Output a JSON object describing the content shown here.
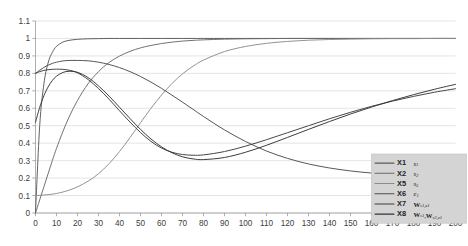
{
  "chart_data": {
    "type": "line",
    "title": "",
    "xlabel": "",
    "ylabel": "",
    "xlim": [
      0,
      200
    ],
    "ylim": [
      0,
      1.1
    ],
    "grid": true,
    "legend_position": "bottom-right",
    "xticks": [
      0,
      10,
      20,
      30,
      40,
      50,
      60,
      70,
      80,
      90,
      100,
      110,
      120,
      130,
      140,
      150,
      160,
      170,
      180,
      190,
      200
    ],
    "yticks": [
      "0",
      "0.1",
      "0.2",
      "0.3",
      "0.4",
      "0.5",
      "0.6",
      "0.7",
      "0.8",
      "0.9",
      "1",
      "1.1"
    ],
    "x": [
      0,
      2,
      4,
      6,
      8,
      10,
      13,
      16,
      20,
      25,
      30,
      35,
      40,
      45,
      50,
      55,
      60,
      65,
      70,
      75,
      80,
      90,
      100,
      110,
      120,
      130,
      140,
      150,
      160,
      170,
      180,
      190,
      200
    ],
    "series": [
      {
        "name": "X1",
        "math": "s1",
        "color": "#5a5a5a",
        "values": [
          0.0,
          0.5,
          0.74,
          0.86,
          0.92,
          0.955,
          0.979,
          0.989,
          0.995,
          0.998,
          0.999,
          1.0,
          1.0,
          1.0,
          1.0,
          1.0,
          1.0,
          1.0,
          1.0,
          1.0,
          1.0,
          1.0,
          1.0,
          1.0,
          1.0,
          1.0,
          1.0,
          1.0,
          1.0,
          1.0,
          1.0,
          1.0,
          1.0
        ]
      },
      {
        "name": "X2",
        "math": "s2",
        "color": "#6a6a6a",
        "values": [
          0.0,
          0.075,
          0.15,
          0.225,
          0.3,
          0.37,
          0.465,
          0.55,
          0.645,
          0.74,
          0.81,
          0.862,
          0.899,
          0.926,
          0.946,
          0.96,
          0.971,
          0.979,
          0.985,
          0.989,
          0.992,
          0.996,
          0.998,
          0.999,
          1.0,
          1.0,
          1.0,
          1.0,
          1.0,
          1.0,
          1.0,
          1.0,
          1.0
        ]
      },
      {
        "name": "X5",
        "math": "s5",
        "color": "#8c8c8c",
        "values": [
          0.1,
          0.101,
          0.103,
          0.105,
          0.108,
          0.112,
          0.12,
          0.131,
          0.15,
          0.182,
          0.225,
          0.282,
          0.352,
          0.432,
          0.517,
          0.6,
          0.676,
          0.742,
          0.797,
          0.841,
          0.876,
          0.925,
          0.954,
          0.972,
          0.983,
          0.99,
          0.994,
          0.996,
          0.998,
          0.999,
          0.999,
          1.0,
          1.0
        ]
      },
      {
        "name": "X6",
        "math": "e1",
        "color": "#4e4e4e",
        "values": [
          0.8,
          0.818,
          0.834,
          0.847,
          0.857,
          0.864,
          0.871,
          0.874,
          0.874,
          0.872,
          0.864,
          0.851,
          0.833,
          0.81,
          0.782,
          0.75,
          0.714,
          0.675,
          0.635,
          0.594,
          0.553,
          0.476,
          0.41,
          0.355,
          0.313,
          0.281,
          0.258,
          0.241,
          0.229,
          0.221,
          0.214,
          0.209,
          0.205
        ]
      },
      {
        "name": "X7",
        "math": "W_s1_e1",
        "color": "#3d3d3d",
        "values": [
          0.8,
          0.81,
          0.817,
          0.821,
          0.823,
          0.824,
          0.823,
          0.818,
          0.803,
          0.765,
          0.713,
          0.652,
          0.586,
          0.521,
          0.461,
          0.41,
          0.372,
          0.348,
          0.335,
          0.331,
          0.333,
          0.352,
          0.383,
          0.42,
          0.46,
          0.5,
          0.54,
          0.577,
          0.611,
          0.641,
          0.668,
          0.692,
          0.712
        ]
      },
      {
        "name": "X8",
        "math": "W_s1_W_s2_e1",
        "color": "#333333",
        "values": [
          0.52,
          0.605,
          0.672,
          0.722,
          0.759,
          0.784,
          0.805,
          0.812,
          0.806,
          0.776,
          0.728,
          0.67,
          0.606,
          0.541,
          0.479,
          0.424,
          0.379,
          0.345,
          0.322,
          0.31,
          0.306,
          0.318,
          0.348,
          0.388,
          0.433,
          0.479,
          0.524,
          0.567,
          0.607,
          0.644,
          0.678,
          0.709,
          0.737
        ]
      }
    ],
    "legend_entries": [
      {
        "name": "X1",
        "math_main": "s",
        "math_sub": "1",
        "math_bold": false,
        "math_second": "",
        "math_second_sub": ""
      },
      {
        "name": "X2",
        "math_main": "s",
        "math_sub": "2",
        "math_bold": false,
        "math_second": "",
        "math_second_sub": ""
      },
      {
        "name": "X5",
        "math_main": "s",
        "math_sub": "5",
        "math_bold": false,
        "math_second": "",
        "math_second_sub": ""
      },
      {
        "name": "X6",
        "math_main": "e",
        "math_sub": "1",
        "math_bold": false,
        "math_second": "",
        "math_second_sub": ""
      },
      {
        "name": "X7",
        "math_main": "W",
        "math_sub": "s1,e1",
        "math_bold": true,
        "math_second": "",
        "math_second_sub": ""
      },
      {
        "name": "X8",
        "math_main": "W",
        "math_sub": "s1",
        "math_bold": true,
        "math_second": "W",
        "math_second_sub": "s2,e1"
      }
    ]
  }
}
